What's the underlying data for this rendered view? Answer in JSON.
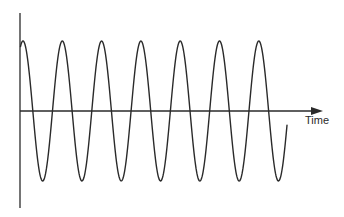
{
  "diagram": {
    "title": "",
    "x_axis_label": "Time",
    "y_axis_label": "",
    "wave_type": "sine",
    "stroke_color": "#2a2a2a",
    "background_color": "#ffffff",
    "visible_cycles": 7,
    "amplitude_px": 70,
    "period_px": 39.3,
    "baseline_y_px": 111,
    "start_x_px": 20,
    "end_x_px": 287,
    "peak_x_px": [
      23,
      62,
      101,
      140,
      179,
      219,
      259
    ],
    "trough_x_px": [
      43,
      82,
      121,
      160,
      200,
      239,
      279
    ]
  }
}
